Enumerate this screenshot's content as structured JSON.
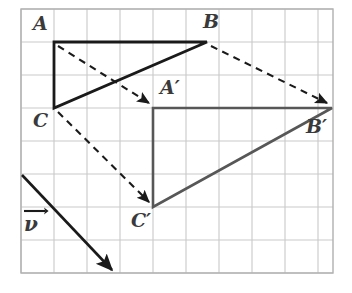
{
  "figure": {
    "background_color": "#ffffff",
    "grid": {
      "show": true,
      "line_color": "#c9c9c9",
      "border_color": "#b0b0b0",
      "origin_x": 21,
      "origin_y": 9,
      "cell_size": 33,
      "cols": 9,
      "rows": 8
    },
    "colors": {
      "preimage": "#1a1a1a",
      "image": "#575757",
      "dashed": "#1a1a1a",
      "vector": "#1a1a1a",
      "label": "#3a3a3a"
    },
    "points": [
      {
        "name": "A",
        "label": "A",
        "x": 54,
        "y": 42,
        "label_x": 33,
        "label_y": 14,
        "set": "preimage"
      },
      {
        "name": "B",
        "label": "B",
        "x": 207,
        "y": 42,
        "label_x": 203,
        "label_y": 12,
        "set": "preimage"
      },
      {
        "name": "C",
        "label": "C",
        "x": 54,
        "y": 108,
        "label_x": 33,
        "label_y": 111,
        "set": "preimage"
      },
      {
        "name": "A'",
        "label": "A′",
        "x": 153,
        "y": 108,
        "label_x": 160,
        "label_y": 78,
        "set": "image"
      },
      {
        "name": "B'",
        "label": "B′",
        "x": 332,
        "y": 108,
        "label_x": 306,
        "label_y": 117,
        "set": "image"
      },
      {
        "name": "C'",
        "label": "C′",
        "x": 153,
        "y": 207,
        "label_x": 131,
        "label_y": 211,
        "set": "image"
      }
    ],
    "preimage_triangle": {
      "name": "triangle-ABC",
      "vertices": [
        "A",
        "B",
        "C"
      ],
      "stroke": "#1a1a1a",
      "stroke_width": 2.6,
      "style": "solid"
    },
    "image_triangle": {
      "name": "triangle-A-prime-B-prime-C-prime",
      "vertices": [
        "A'",
        "B'",
        "C'"
      ],
      "stroke": "#575757",
      "stroke_width": 2.6,
      "style": "solid"
    },
    "mapping_arrows": [
      {
        "name": "A-to-A-prime",
        "from": "A",
        "to": "A'",
        "x1": 58,
        "y1": 46,
        "x2": 149,
        "y2": 104
      },
      {
        "name": "B-to-B-prime",
        "from": "B",
        "to": "B'",
        "x1": 211,
        "y1": 46,
        "x2": 328,
        "y2": 104
      },
      {
        "name": "C-to-C-prime",
        "from": "C",
        "to": "C'",
        "x1": 58,
        "y1": 112,
        "x2": 149,
        "y2": 203
      }
    ],
    "translation_vector": {
      "name": "vector-v",
      "label": "ν",
      "label_x": 24,
      "label_y": 224,
      "x1": 22,
      "y1": 175,
      "x2": 114,
      "y2": 272,
      "dx_cells": 3,
      "dy_cells": 3,
      "dx_px": 99,
      "dy_px": 99
    }
  }
}
